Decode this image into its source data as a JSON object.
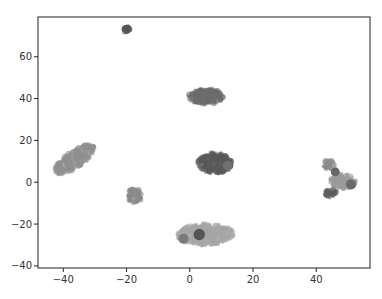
{
  "chart_data": {
    "type": "scatter",
    "title": "",
    "xlabel": "",
    "ylabel": "",
    "xlim": [
      -48,
      57
    ],
    "ylim": [
      -41,
      79
    ],
    "grid": false,
    "legend": null,
    "x_ticks": [
      -40,
      -20,
      0,
      20,
      40
    ],
    "y_ticks": [
      -40,
      -20,
      0,
      20,
      40,
      60
    ],
    "x_tick_labels": [
      "−40",
      "−20",
      "0",
      "20",
      "40"
    ],
    "y_tick_labels": [
      "−40",
      "−20",
      "0",
      "20",
      "40",
      "60"
    ],
    "clusters": [
      {
        "name": "cluster-left-elongated",
        "cx": -36.5,
        "cy": 11,
        "rx": 7.5,
        "ry": 4,
        "angle": -35,
        "color": "#8f8f8f"
      },
      {
        "name": "cluster-top-small",
        "cx": -20,
        "cy": 73,
        "rx": 1.1,
        "ry": 1.4,
        "angle": 0,
        "color": "#555555"
      },
      {
        "name": "cluster-upper-center",
        "cx": 5,
        "cy": 41,
        "rx": 5.5,
        "ry": 3.8,
        "angle": 0,
        "color": "#6b6b6b"
      },
      {
        "name": "cluster-center",
        "cx": 8,
        "cy": 9,
        "rx": 5.5,
        "ry": 5,
        "angle": 0,
        "color": "#5a5a5a"
      },
      {
        "name": "cluster-left-small",
        "cx": -17.5,
        "cy": -6.5,
        "rx": 2.4,
        "ry": 3.5,
        "angle": 0,
        "color": "#8a8a8a"
      },
      {
        "name": "cluster-bottom-center",
        "cx": 5,
        "cy": -25,
        "rx": 9,
        "ry": 5,
        "angle": 0,
        "color": "#a5a5a5"
      },
      {
        "name": "cluster-right-a",
        "cx": 44,
        "cy": 8.5,
        "rx": 2,
        "ry": 2.2,
        "angle": 0,
        "color": "#8c8c8c"
      },
      {
        "name": "cluster-right-b",
        "cx": 48.5,
        "cy": 0.5,
        "rx": 4,
        "ry": 3.5,
        "angle": 0,
        "color": "#9a9a9a"
      },
      {
        "name": "cluster-right-c",
        "cx": 44.5,
        "cy": -5,
        "rx": 2,
        "ry": 2.2,
        "angle": 0,
        "color": "#5c5c5c"
      }
    ],
    "accent_points": [
      {
        "x": 3,
        "y": -25,
        "r": 1.8,
        "color": "#555555"
      },
      {
        "x": -2,
        "y": -27,
        "r": 1.6,
        "color": "#7a7a7a"
      },
      {
        "x": 46,
        "y": 5,
        "r": 1.4,
        "color": "#666666"
      },
      {
        "x": 51,
        "y": -1,
        "r": 1.6,
        "color": "#6a6a6a"
      },
      {
        "x": 12,
        "y": 8,
        "r": 1.5,
        "color": "#707070"
      }
    ]
  }
}
